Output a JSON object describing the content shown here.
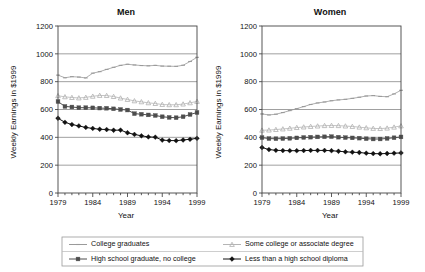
{
  "figure": {
    "width": 425,
    "height": 272,
    "background": "#ffffff"
  },
  "chart_data": [
    {
      "type": "line",
      "title": "Men",
      "xlabel": "Year",
      "ylabel": "Weekly Earnings in $1999",
      "xlim": [
        1979,
        1999
      ],
      "ylim": [
        0,
        1200
      ],
      "yticks": [
        0,
        200,
        400,
        600,
        800,
        1000,
        1200
      ],
      "xticks": [
        1979,
        1984,
        1989,
        1994,
        1999
      ],
      "grid": "horizontal",
      "legend_position": "bottom-shared",
      "x": [
        1979,
        1980,
        1981,
        1982,
        1983,
        1984,
        1985,
        1986,
        1987,
        1988,
        1989,
        1990,
        1991,
        1992,
        1993,
        1994,
        1995,
        1996,
        1997,
        1998,
        1999
      ],
      "series": [
        {
          "name": "College graduates",
          "color": "#9a9a9a",
          "marker": "dash",
          "values": [
            847,
            828,
            836,
            833,
            827,
            861,
            872,
            888,
            903,
            917,
            925,
            920,
            916,
            914,
            917,
            912,
            911,
            910,
            918,
            945,
            975
          ]
        },
        {
          "name": "Some college or associate degree",
          "color": "#b5b5b5",
          "marker": "triangle",
          "values": [
            699,
            691,
            686,
            683,
            687,
            695,
            701,
            700,
            693,
            682,
            672,
            662,
            655,
            648,
            643,
            636,
            634,
            634,
            639,
            648,
            658
          ]
        },
        {
          "name": "High school graduate, no college",
          "color": "#4d4d4d",
          "marker": "square",
          "values": [
            657,
            622,
            618,
            613,
            613,
            612,
            610,
            609,
            605,
            600,
            596,
            570,
            566,
            561,
            557,
            548,
            543,
            541,
            548,
            564,
            578
          ]
        },
        {
          "name": "Less than a high school diploma",
          "color": "#111111",
          "marker": "diamond",
          "values": [
            537,
            508,
            492,
            482,
            471,
            464,
            458,
            456,
            451,
            452,
            433,
            421,
            411,
            403,
            401,
            380,
            377,
            376,
            381,
            386,
            393
          ]
        }
      ]
    },
    {
      "type": "line",
      "title": "Women",
      "xlabel": "Year",
      "ylabel": "Weekly Earnings in $1999",
      "xlim": [
        1979,
        1999
      ],
      "ylim": [
        0,
        1200
      ],
      "yticks": [
        0,
        200,
        400,
        600,
        800,
        1000,
        1200
      ],
      "xticks": [
        1979,
        1984,
        1989,
        1994,
        1999
      ],
      "grid": "horizontal",
      "legend_position": "bottom-shared",
      "x": [
        1979,
        1980,
        1981,
        1982,
        1983,
        1984,
        1985,
        1986,
        1987,
        1988,
        1989,
        1990,
        1991,
        1992,
        1993,
        1994,
        1995,
        1996,
        1997,
        1998,
        1999
      ],
      "series": [
        {
          "name": "College graduates",
          "color": "#9a9a9a",
          "marker": "dash",
          "values": [
            568,
            561,
            566,
            578,
            592,
            606,
            621,
            636,
            647,
            654,
            663,
            669,
            673,
            680,
            688,
            697,
            700,
            694,
            692,
            712,
            738
          ]
        },
        {
          "name": "Some college or associate degree",
          "color": "#b5b5b5",
          "marker": "triangle",
          "values": [
            451,
            452,
            456,
            460,
            465,
            470,
            474,
            478,
            481,
            484,
            485,
            484,
            481,
            478,
            473,
            468,
            464,
            463,
            466,
            473,
            482
          ]
        },
        {
          "name": "High school graduate, no college",
          "color": "#4d4d4d",
          "marker": "square",
          "values": [
            398,
            391,
            390,
            391,
            393,
            396,
            399,
            401,
            403,
            404,
            405,
            401,
            398,
            396,
            394,
            390,
            388,
            388,
            392,
            397,
            403
          ]
        },
        {
          "name": "Less than a high school diploma",
          "color": "#111111",
          "marker": "diamond",
          "values": [
            327,
            312,
            307,
            305,
            304,
            304,
            305,
            306,
            306,
            306,
            304,
            300,
            296,
            293,
            291,
            286,
            283,
            282,
            284,
            286,
            288
          ]
        }
      ]
    }
  ],
  "legend": {
    "entries": [
      {
        "label": "College graduates",
        "color": "#9a9a9a",
        "marker": "dash"
      },
      {
        "label": "Some college or associate degree",
        "color": "#b5b5b5",
        "marker": "triangle"
      },
      {
        "label": "High school graduate, no college",
        "color": "#4d4d4d",
        "marker": "square"
      },
      {
        "label": "Less than a high school diploma",
        "color": "#111111",
        "marker": "diamond"
      }
    ]
  }
}
